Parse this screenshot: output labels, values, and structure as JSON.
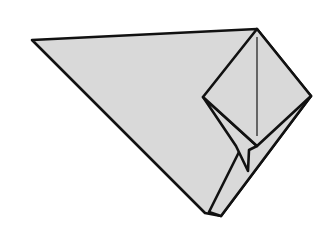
{
  "diagram": {
    "type": "origami-step",
    "colors": {
      "paper": "#d9d9d9",
      "line": "#111111",
      "background": "#ffffff"
    },
    "shapes": {
      "main_body": "32,40 257,29 311,96 221,216 205,213",
      "back_flap": "245,140 311,96 221,216 209,212",
      "diamond": "257,29 311,96 257,146 203,97",
      "inner_pocket": "203,97 257,146 249,150 248,171 236,146",
      "crease": {
        "x1": 257,
        "y1": 37,
        "x2": 257,
        "y2": 136
      }
    }
  }
}
